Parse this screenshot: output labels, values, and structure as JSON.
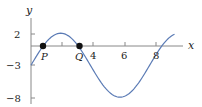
{
  "chart_data": {
    "type": "line",
    "title": "",
    "xlabel": "x",
    "ylabel": "y",
    "x_ticks": [
      2,
      4,
      6,
      8
    ],
    "x_tick_labels": [
      "",
      "4",
      "6",
      "8"
    ],
    "y_ticks": [
      2,
      -3,
      -8
    ],
    "y_tick_labels": [
      "2",
      "−3",
      "−8"
    ],
    "xlim": [
      0,
      9.7
    ],
    "ylim": [
      -8.5,
      3.5
    ],
    "grid": false,
    "legend": null,
    "series": [
      {
        "name": "curve",
        "formula": "y = -3 + 5*sin(0.826*x)",
        "color": "#5b7bb5",
        "x": [
          0,
          0.5,
          1,
          1.5,
          1.9,
          2.5,
          3,
          3.5,
          4,
          4.5,
          5,
          5.5,
          5.7,
          6,
          6.5,
          7,
          7.5,
          8,
          8.5,
          9,
          9.2
        ],
        "y": [
          -3,
          -1.0,
          0.68,
          1.73,
          2.0,
          1.5,
          0.0,
          -1.8,
          -3.6,
          -5.3,
          -6.7,
          -7.7,
          -8.0,
          -7.9,
          -7.2,
          -5.9,
          -4.3,
          -2.4,
          -0.6,
          1.3,
          1.85
        ]
      }
    ],
    "points": [
      {
        "label": "P",
        "x": 0.78,
        "y": 0,
        "color": "#111111"
      },
      {
        "label": "Q",
        "x": 3.0,
        "y": 0,
        "color": "#111111"
      }
    ],
    "annotations": [
      "P",
      "Q"
    ]
  },
  "labels": {
    "x_axis": "x",
    "y_axis": "y",
    "point_p": "P",
    "point_q": "Q",
    "xtick_4": "4",
    "xtick_6": "6",
    "xtick_8": "8",
    "ytick_2": "2",
    "ytick_m3": "−3",
    "ytick_m8": "−8"
  },
  "colors": {
    "curve": "#5b7bb5",
    "axis": "#888888",
    "point": "#111111"
  }
}
